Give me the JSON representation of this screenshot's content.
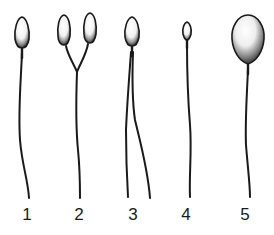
{
  "figure": {
    "background_color": "#ffffff",
    "ink_color": "#1a1a1a",
    "labels": [
      "1",
      "2",
      "3",
      "4",
      "5"
    ],
    "specimens": [
      {
        "label": "1",
        "type": "normal",
        "heads": 1,
        "tails": 1
      },
      {
        "label": "2",
        "type": "double-head",
        "heads": 2,
        "tails": 1
      },
      {
        "label": "3",
        "type": "double-tail",
        "heads": 1,
        "tails": 2
      },
      {
        "label": "4",
        "type": "small-head",
        "heads": 1,
        "tails": 1
      },
      {
        "label": "5",
        "type": "large-head",
        "heads": 1,
        "tails": 1
      }
    ]
  }
}
